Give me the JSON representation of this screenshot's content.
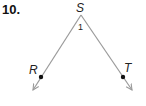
{
  "problem_number": "10.",
  "diagram": {
    "type": "angle",
    "vertex": {
      "label": "S",
      "x": 81,
      "y": 15
    },
    "angle_label": "1",
    "rays": [
      {
        "name": "ray-SR",
        "point_label": "R",
        "point": {
          "x": 41,
          "y": 77
        },
        "end": {
          "x": 33,
          "y": 90
        }
      },
      {
        "name": "ray-ST",
        "point_label": "T",
        "point": {
          "x": 123,
          "y": 77
        },
        "end": {
          "x": 132,
          "y": 90
        }
      }
    ],
    "colors": {
      "line": "#9a9a9a",
      "point": "#111111",
      "text": "#222222"
    }
  }
}
